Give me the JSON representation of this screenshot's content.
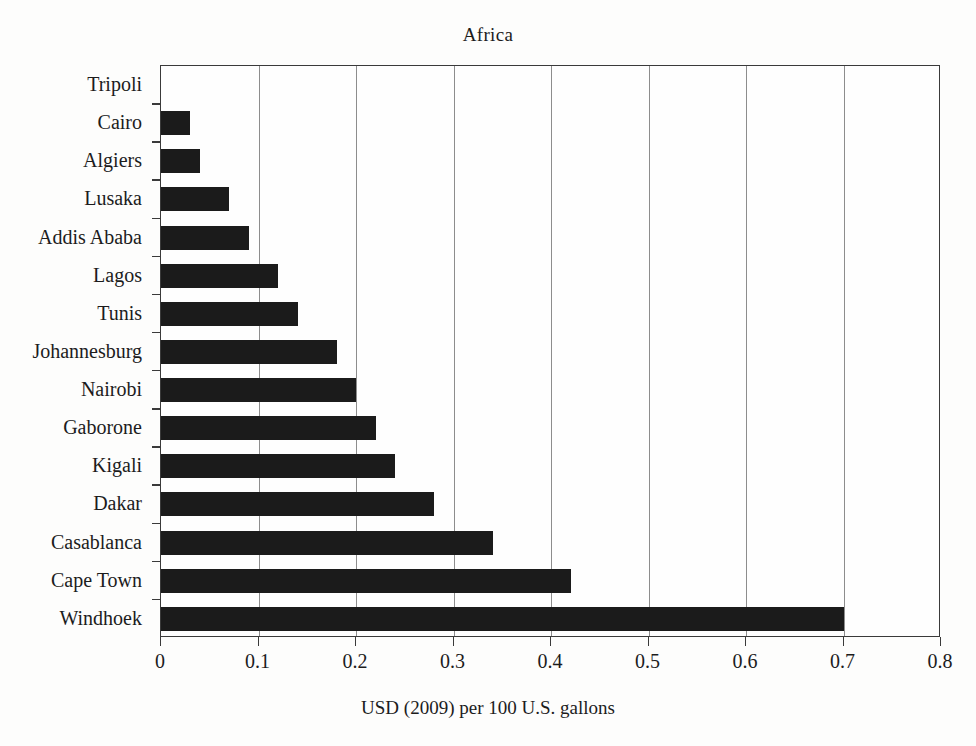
{
  "chart_data": {
    "type": "bar",
    "orientation": "horizontal",
    "title": "Africa",
    "xlabel": "USD (2009) per 100 U.S. gallons",
    "ylabel": "",
    "categories": [
      "Tripoli",
      "Cairo",
      "Algiers",
      "Lusaka",
      "Addis Ababa",
      "Lagos",
      "Tunis",
      "Johannesburg",
      "Nairobi",
      "Gaborone",
      "Kigali",
      "Dakar",
      "Casablanca",
      "Cape Town",
      "Windhoek"
    ],
    "values": [
      0.0,
      0.03,
      0.04,
      0.07,
      0.09,
      0.12,
      0.14,
      0.18,
      0.2,
      0.22,
      0.24,
      0.28,
      0.34,
      0.42,
      0.7
    ],
    "xlim": [
      0,
      0.8
    ],
    "xticks": [
      0,
      0.1,
      0.2,
      0.3,
      0.4,
      0.5,
      0.6,
      0.7,
      0.8
    ],
    "xtick_labels": [
      "0",
      "0.1",
      "0.2",
      "0.3",
      "0.4",
      "0.5",
      "0.6",
      "0.7",
      "0.8"
    ],
    "grid": "vertical",
    "legend": null,
    "bar_color": "#1b1b1b",
    "axis_color": "#3a3a3a",
    "grid_color": "#8d8d8d",
    "background": "#fefefe"
  }
}
